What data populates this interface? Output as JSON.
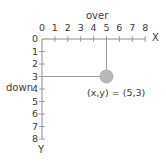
{
  "title": "over",
  "axis_labels": {
    "x": "X",
    "y": "Y",
    "over": "over",
    "down": "down"
  },
  "x_ticks": [
    "0",
    "1",
    "2",
    "3",
    "4",
    "5",
    "6",
    "7",
    "8"
  ],
  "y_ticks": [
    "0",
    "1",
    "2",
    "3",
    "4",
    "5",
    "6",
    "7",
    "8"
  ],
  "point": {
    "x": 5,
    "y": 3,
    "label": "(x,y) = (5,3)",
    "color": "#b8b8b8"
  },
  "colors": {
    "axis": "#8a8a8a",
    "guide": "#9a9a9a",
    "text": "#3a3a3a"
  }
}
